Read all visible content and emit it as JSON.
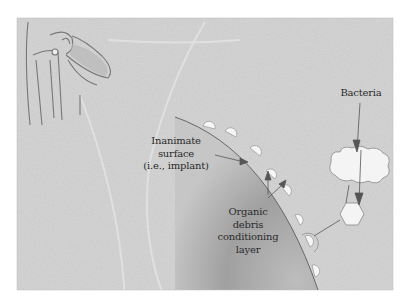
{
  "figure": {
    "background_color": "#c9c9c9",
    "frame": {
      "x": 17,
      "y": 18,
      "width": 376,
      "height": 272
    },
    "labels": {
      "inanimate_surface": [
        "Inanimate",
        "surface",
        "(i.e., implant)"
      ],
      "organic_layer": [
        "Organic",
        "debris",
        "conditioning",
        "layer"
      ],
      "bacteria": "Bacteria"
    },
    "icons": [
      "hip-joint-illustration",
      "implant-surface-curve",
      "bacteria-cloud",
      "bacteria-hexagon",
      "adhered-bacteria-bubbles"
    ],
    "colors": {
      "surface_shadow": "#9a9a9a",
      "line": "#555555",
      "bubble": "#f6f6f6",
      "text": "#2b2b2b"
    }
  }
}
